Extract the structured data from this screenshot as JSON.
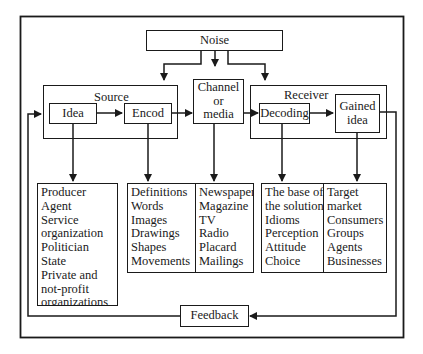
{
  "diagram": {
    "noise": "Noise",
    "source": {
      "group_label": "Source",
      "idea": "Idea",
      "encode": "Encod"
    },
    "channel": {
      "line1": "Channel",
      "line2": "or",
      "line3": "media"
    },
    "receiver": {
      "group_label": "Receiver",
      "decoding": "Decoding",
      "gained_idea_line1": "Gained",
      "gained_idea_line2": "idea"
    },
    "feedback": "Feedback",
    "lists": {
      "idea": [
        "Producer",
        "Agent",
        "Service",
        "organization",
        "Politician",
        "State",
        "Private and",
        "not-profit",
        "organizations"
      ],
      "encode": [
        "Definitions",
        "Words",
        "Images",
        "Drawings",
        "Shapes",
        "Movements"
      ],
      "channel": [
        "Newspaper",
        "Magazine",
        "TV",
        "Radio",
        "Placard",
        "Mailings"
      ],
      "decoding": [
        "The base of",
        "the solution",
        "Idioms",
        "Perception",
        "Attitude",
        "Choice"
      ],
      "gained_idea": [
        "Target",
        "market",
        "Consumers",
        "Groups",
        "Agents",
        "Businesses"
      ]
    }
  }
}
